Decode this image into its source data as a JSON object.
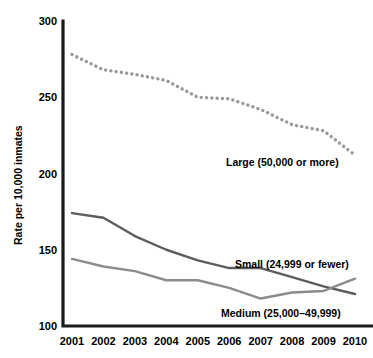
{
  "chart_data": {
    "type": "line",
    "title": "",
    "subtitle": "",
    "xlabel": "",
    "ylabel": "Rate per 10,000 inmates",
    "categories": [
      "2001",
      "2002",
      "2003",
      "2004",
      "2005",
      "2006",
      "2007",
      "2008",
      "2009",
      "2010"
    ],
    "x": [
      2001,
      2002,
      2003,
      2004,
      2005,
      2006,
      2007,
      2008,
      2009,
      2010
    ],
    "xlim": [
      2001,
      2010
    ],
    "ylim": [
      100,
      300
    ],
    "yticks": [
      100,
      150,
      200,
      250,
      300
    ],
    "ytick_labels": [
      "100",
      "150",
      "200",
      "250",
      "300"
    ],
    "grid": false,
    "legend_position": "inline-annotations",
    "series": [
      {
        "name": "Large (50,000 or more)",
        "style": "dotted",
        "color": "#9a9a9a",
        "values": [
          278,
          268,
          265,
          261,
          250,
          249,
          242,
          232,
          228,
          212
        ],
        "label": "Large (50,000 or more)"
      },
      {
        "name": "Small (24,999 or fewer)",
        "style": "solid",
        "color": "#5d5d5d",
        "values": [
          174,
          171,
          159,
          150,
          143,
          138,
          138,
          132,
          126,
          121
        ],
        "label": "Small (24,999 or fewer)"
      },
      {
        "name": "Medium (25,000-49,999)",
        "style": "solid",
        "color": "#8c8c8c",
        "values": [
          144,
          139,
          136,
          130,
          130,
          125,
          118,
          122,
          123,
          131
        ],
        "label": "Medium (25,000–49,999)"
      }
    ],
    "annotations": [
      {
        "text": "Large (50,000 or more)",
        "x_px": 226,
        "y_px": 166
      },
      {
        "text": "Small (24,999 or fewer)",
        "x_px": 235,
        "y_px": 268
      },
      {
        "text": "Medium (25,000–49,999)",
        "x_px": 221,
        "y_px": 317
      }
    ],
    "colors": {
      "axis": "#1a1a1a",
      "large": "#9a9a9a",
      "small": "#5d5d5d",
      "medium": "#8c8c8c",
      "background": "#ffffff",
      "text": "#000000"
    }
  }
}
